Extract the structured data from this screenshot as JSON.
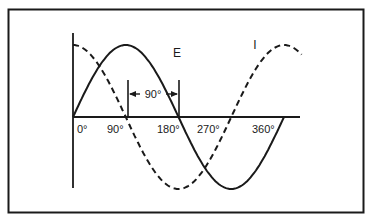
{
  "diagram": {
    "type": "phase-relationship",
    "colors": {
      "ink": "#1a1a1a",
      "background": "#ffffff"
    },
    "curves": [
      {
        "name": "E",
        "label": "E",
        "style": "solid",
        "function": "sin"
      },
      {
        "name": "I",
        "label": "I",
        "style": "dashed",
        "function": "cos"
      }
    ],
    "x_ticks": [
      "0°",
      "90°",
      "180°",
      "270°",
      "360°"
    ],
    "phase_marker": {
      "label": "90°"
    }
  }
}
